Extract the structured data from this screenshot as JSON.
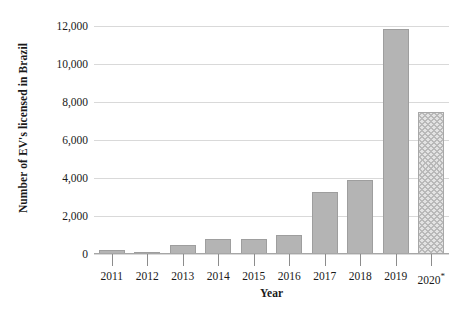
{
  "chart_data": {
    "type": "bar",
    "title": "",
    "xlabel": "Year",
    "ylabel": "Number of EV's licensed in Brazil",
    "categories": [
      "2011",
      "2012",
      "2013",
      "2014",
      "2015",
      "2016",
      "2017",
      "2018",
      "2019",
      "2020*"
    ],
    "values": [
      200,
      100,
      470,
      800,
      800,
      1000,
      3250,
      3900,
      11850,
      7500
    ],
    "ylim": [
      0,
      12000
    ],
    "yticks": [
      0,
      2000,
      4000,
      6000,
      8000,
      10000,
      12000
    ],
    "ytick_labels": [
      "0",
      "2,000",
      "4,000",
      "6,000",
      "8,000",
      "10,000",
      "12,000"
    ],
    "grid": true,
    "legend": "none",
    "series": [
      {
        "name": "EV's licensed in Brazil",
        "values": [
          200,
          100,
          470,
          800,
          800,
          1000,
          3250,
          3900,
          11850,
          7500
        ]
      }
    ],
    "bar_styles": [
      "solid",
      "solid",
      "solid",
      "solid",
      "solid",
      "solid",
      "solid",
      "solid",
      "solid",
      "hatched"
    ],
    "annotations": [
      "* 2020 value is marked with an asterisk"
    ],
    "colors": {
      "bar_fill": "#b4b4b4",
      "bar_border": "#9e9e9e",
      "projected_fill": "#e3e3e3",
      "projected_hatch": "#b9b9b9",
      "gridline": "#d9d9d9",
      "axis": "#a6a6a6",
      "text": "#1a1a1a"
    }
  },
  "axes": {
    "y_title": "Number of EV's licensed in Brazil",
    "x_title": "Year"
  },
  "x_labels": [
    {
      "text": "2011",
      "asterisk": ""
    },
    {
      "text": "2012",
      "asterisk": ""
    },
    {
      "text": "2013",
      "asterisk": ""
    },
    {
      "text": "2014",
      "asterisk": ""
    },
    {
      "text": "2015",
      "asterisk": ""
    },
    {
      "text": "2016",
      "asterisk": ""
    },
    {
      "text": "2017",
      "asterisk": ""
    },
    {
      "text": "2018",
      "asterisk": ""
    },
    {
      "text": "2019",
      "asterisk": ""
    },
    {
      "text": "2020",
      "asterisk": "*"
    }
  ]
}
